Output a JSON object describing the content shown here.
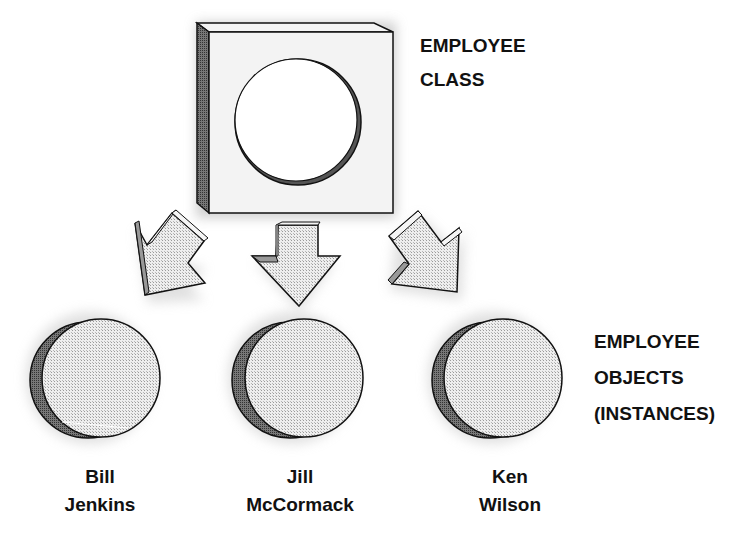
{
  "diagram": {
    "class_label": {
      "line1": "EMPLOYEE",
      "line2": "CLASS"
    },
    "objects_label": {
      "line1": "EMPLOYEE",
      "line2": "OBJECTS",
      "line3": "(INSTANCES)"
    },
    "objects": [
      {
        "first": "Bill",
        "last": "Jenkins"
      },
      {
        "first": "Jill",
        "last": "McCormack"
      },
      {
        "first": "Ken",
        "last": "Wilson"
      }
    ],
    "colors": {
      "stroke": "#111111",
      "face": "#e2e2e2",
      "side": "#9a9a9a",
      "shadow": "#cfcfcf",
      "dark_rim": "#444444"
    }
  }
}
